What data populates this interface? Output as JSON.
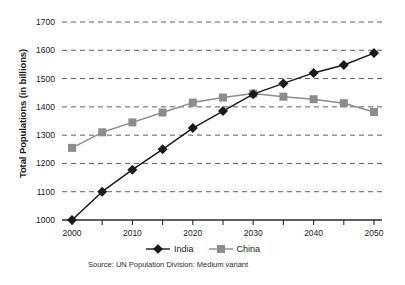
{
  "chart_data": {
    "type": "line",
    "title": "",
    "xlabel": "",
    "ylabel": "Total Populations (in billions)",
    "x": [
      2000,
      2005,
      2010,
      2015,
      2020,
      2025,
      2030,
      2035,
      2040,
      2045,
      2050
    ],
    "xtick_labels": [
      "2000",
      "2010",
      "2020",
      "2030",
      "2040",
      "2050"
    ],
    "xtick_values": [
      2000,
      2010,
      2020,
      2030,
      2040,
      2050
    ],
    "xlim": [
      2000,
      2050
    ],
    "ytick_labels": [
      "1000",
      "1100",
      "1200",
      "1300",
      "1400",
      "1500",
      "1600",
      "1700"
    ],
    "ytick_values": [
      1000,
      1100,
      1200,
      1300,
      1400,
      1500,
      1600,
      1700
    ],
    "ylim": [
      1000,
      1700
    ],
    "grid": "horizontal-dashed",
    "legend_position": "bottom-center",
    "series": [
      {
        "name": "India",
        "color": "#1a1a1a",
        "marker": "diamond",
        "values": [
          1000,
          1100,
          1178,
          1250,
          1325,
          1385,
          1445,
          1483,
          1520,
          1548,
          1590
        ]
      },
      {
        "name": "China",
        "color": "#8c8c8c",
        "marker": "square",
        "values": [
          1255,
          1310,
          1345,
          1380,
          1415,
          1433,
          1447,
          1436,
          1427,
          1413,
          1382
        ]
      }
    ],
    "source_note": "Source: UN Population Division: Medium variant"
  },
  "legend": {
    "items": [
      {
        "label": "India"
      },
      {
        "label": "China"
      }
    ]
  },
  "colors": {
    "india": "#1a1a1a",
    "china": "#8c8c8c",
    "gridline": "#4d4d4d",
    "axis": "#2b2b2b",
    "background": "#ffffff"
  }
}
